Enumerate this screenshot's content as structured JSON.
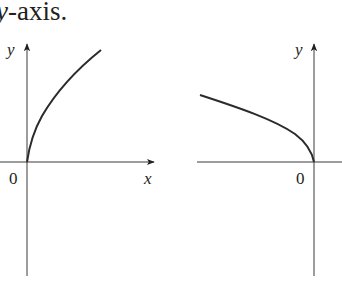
{
  "caption": {
    "var": "y",
    "rest": "-axis."
  },
  "graphs": [
    {
      "id": "left",
      "description": "Graph of y = sqrt(x), starting at origin and rising to the right",
      "y_label": "y",
      "x_label": "x",
      "origin_label": "0"
    },
    {
      "id": "right",
      "description": "Graph of y = sqrt(-x), reflection about the y-axis, rising to the left",
      "y_label": "y",
      "origin_label": "0"
    }
  ],
  "colors": {
    "ink": "#231f20",
    "axis": "#3a3a3a",
    "curve": "#2b2b2b"
  }
}
